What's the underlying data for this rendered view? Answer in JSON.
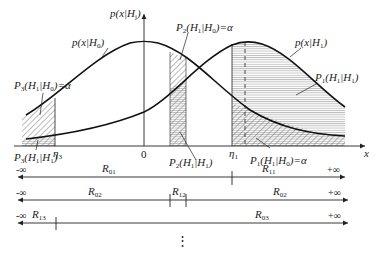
{
  "diagram": {
    "type": "binary-hypothesis-test-likelihoods",
    "axis": {
      "x_label": "x",
      "y_label": "p(x|H_j)",
      "origin_label": "0"
    },
    "curves": [
      {
        "id": "H0",
        "label": "p(x|H_0)",
        "peak_x": 0
      },
      {
        "id": "H1",
        "label": "p(x|H_1)"
      }
    ],
    "thresholds": [
      {
        "id": "eta3",
        "label": "η_3"
      },
      {
        "id": "eta1",
        "label": "η_1"
      }
    ],
    "areas": [
      {
        "id": "P3_H1_H0",
        "label": "P_3(H_1|H_0)=α",
        "pattern": "diagonal-hatch"
      },
      {
        "id": "P3_H1_H1",
        "label": "P_3(H_1|H_1)",
        "pattern": "horizontal-lines"
      },
      {
        "id": "P2_H1_H0",
        "label": "P_2(H_1|H_0)=α",
        "pattern": "diagonal-hatch"
      },
      {
        "id": "P2_H1_H1",
        "label": "P_2(H_1|H_1)",
        "pattern": "horizontal-lines"
      },
      {
        "id": "P1_H1_H1",
        "label": "P_1(H_1|H_1)",
        "pattern": "horizontal-lines"
      },
      {
        "id": "P1_H1_H0",
        "label": "P_1(H_1|H_0)=α",
        "pattern": "diagonal-hatch"
      }
    ],
    "region_lines": [
      {
        "segments": [
          {
            "label": "R_01",
            "from": "-∞",
            "to": "η_1"
          },
          {
            "label": "R_11",
            "from": "η_1",
            "to": "+∞"
          }
        ]
      },
      {
        "segments": [
          {
            "label": "R_02",
            "from": "-∞"
          },
          {
            "label": "R_12"
          },
          {
            "label": "R_02",
            "to": "+∞"
          }
        ]
      },
      {
        "segments": [
          {
            "label": "R_13",
            "from": "-∞"
          },
          {
            "label": "R_03",
            "to": "+∞"
          }
        ]
      }
    ],
    "continuation": "⋮"
  },
  "text": {
    "y_axis_label_main": "p(x|H",
    "y_axis_label_sub": "j",
    "x_axis_label": "x",
    "origin": "0",
    "h0_curve_main": "p(x|H",
    "h0_curve_sub": "0",
    "h1_curve_main": "p(x|H",
    "h1_curve_sub": "1",
    "eta3": "η",
    "eta3_sub": "3",
    "eta1": "η",
    "eta1_sub": "1",
    "p3_alpha": {
      "p": "P",
      "ps": "3",
      "a": "(H",
      "as": "1",
      "b": "|H",
      "bs": "0",
      "c": ")=α"
    },
    "p3_hit": {
      "p": "P",
      "ps": "3",
      "a": "(H",
      "as": "1",
      "b": "|H",
      "bs": "1",
      "c": ")"
    },
    "p2_alpha": {
      "p": "P",
      "ps": "2",
      "a": "(H",
      "as": "1",
      "b": "|H",
      "bs": "0",
      "c": ")=α"
    },
    "p2_hit": {
      "p": "P",
      "ps": "2",
      "a": "(H",
      "as": "1",
      "b": "|H",
      "bs": "1",
      "c": ")"
    },
    "p1_hit": {
      "p": "P",
      "ps": "1",
      "a": "(H",
      "as": "1",
      "b": "|H",
      "bs": "1",
      "c": ")"
    },
    "p1_alpha": {
      "p": "P",
      "ps": "1",
      "a": "(H",
      "as": "1",
      "b": "|H",
      "bs": "0",
      "c": ")=α"
    },
    "neg_inf": "-∞",
    "pos_inf": "+∞",
    "R": "R",
    "r01": "01",
    "r11": "11",
    "r02": "02",
    "r12": "12",
    "r13": "13",
    "r03": "03",
    "dots": "⋮"
  }
}
